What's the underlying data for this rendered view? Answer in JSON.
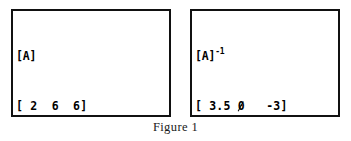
{
  "figure": {
    "caption": "Figure 1"
  },
  "screens": [
    {
      "id": "calc-screen-a",
      "header": "[A]",
      "exponent": "",
      "matrix_label": "A",
      "rows": [
        "[ 2  6  6]",
        "[ 2  7  6]",
        "[ 2  7  7]"
      ]
    },
    {
      "id": "calc-screen-ai",
      "header": "[A]",
      "exponent": "-1",
      "matrix_label": "A inverse",
      "rows": [
        "[ 3.5  0   -3]",
        "[ -1   1   0 ]",
        "[ 0   -1   1 ]"
      ]
    }
  ],
  "matrix_a": {
    "name": "[A]",
    "rows": [
      [
        "2",
        "6",
        "6"
      ],
      [
        "2",
        "7",
        "6"
      ],
      [
        "2",
        "7",
        "7"
      ]
    ]
  },
  "matrix_a_inverse": {
    "name": "[A]-1",
    "rows": [
      [
        "3.5",
        "0",
        "-3"
      ],
      [
        "-1",
        "1",
        "0"
      ],
      [
        "0",
        "-1",
        "1"
      ]
    ]
  },
  "colors": {
    "border": "#111111",
    "background": "#ffffff",
    "text": "#000000"
  }
}
